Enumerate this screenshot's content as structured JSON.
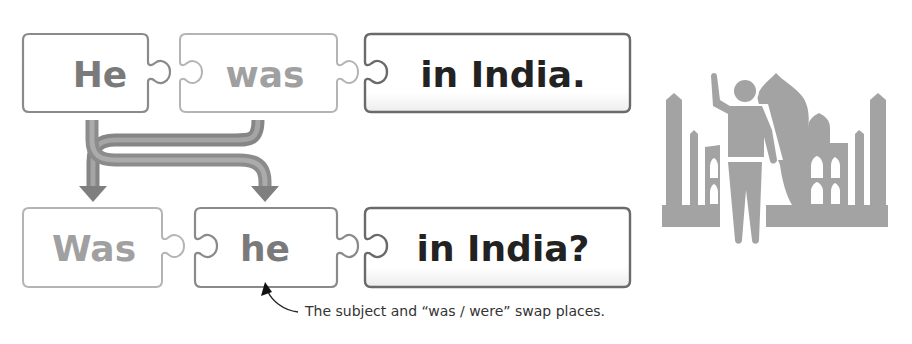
{
  "diagram": {
    "statement": {
      "pieces": [
        {
          "text": "He",
          "role": "subject",
          "color": "#7a7a7a",
          "border": "#8a8a8a"
        },
        {
          "text": "was",
          "role": "verb",
          "color": "#a0a0a0",
          "border": "#b4b4b4"
        },
        {
          "text": "in India.",
          "role": "rest",
          "color": "#222222",
          "border": "#6a6a6a"
        }
      ]
    },
    "question": {
      "pieces": [
        {
          "text": "Was",
          "role": "verb",
          "color": "#a0a0a0",
          "border": "#b4b4b4"
        },
        {
          "text": "he",
          "role": "subject",
          "color": "#7a7a7a",
          "border": "#8a8a8a"
        },
        {
          "text": "in India?",
          "role": "rest",
          "color": "#222222",
          "border": "#6a6a6a"
        }
      ]
    },
    "swap_arrows": {
      "description": "Subject and verb cross over",
      "color": "#8a8a8a"
    },
    "annotation": {
      "text": "The subject and “was / were” swap places.",
      "points_to": "he"
    },
    "illustration": {
      "icon": "tourist-at-taj-mahal-icon",
      "color": "#a3a3a3"
    }
  }
}
